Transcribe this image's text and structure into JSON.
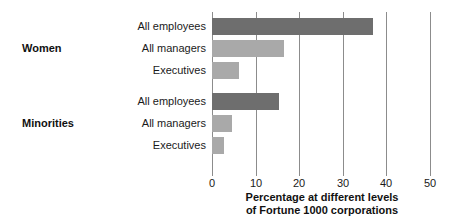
{
  "chart_data": {
    "type": "bar",
    "orientation": "horizontal",
    "title": "",
    "xlabel_lines": [
      "Percentage at different levels",
      "of Fortune 1000 corporations"
    ],
    "ylabel": "",
    "xlim": [
      0,
      50
    ],
    "xticks": [
      0,
      10,
      20,
      30,
      40,
      50
    ],
    "xtick_labels": [
      "0",
      "10",
      "20",
      "30",
      "40",
      "50"
    ],
    "grid": true,
    "grid_axis": "x",
    "legend": "none",
    "groups": [
      {
        "name": "Women",
        "bars": [
          {
            "label": "All employees",
            "value": 37,
            "color": "#6e6e6e"
          },
          {
            "label": "All managers",
            "value": 16.5,
            "color": "#a9a9a9"
          },
          {
            "label": "Executives",
            "value": 6.3,
            "color": "#a9a9a9"
          }
        ]
      },
      {
        "name": "Minorities",
        "bars": [
          {
            "label": "All employees",
            "value": 15.3,
            "color": "#6e6e6e"
          },
          {
            "label": "All managers",
            "value": 4.6,
            "color": "#a9a9a9"
          },
          {
            "label": "Executives",
            "value": 2.7,
            "color": "#a9a9a9"
          }
        ]
      }
    ],
    "categories": [
      "Women - All employees",
      "Women - All managers",
      "Women - Executives",
      "Minorities - All employees",
      "Minorities - All managers",
      "Minorities - Executives"
    ],
    "values": [
      37,
      16.5,
      6.3,
      15.3,
      4.6,
      2.7
    ],
    "colors": {
      "all_employees": "#6e6e6e",
      "managers_executives": "#a9a9a9",
      "axis": "#8c8c8c",
      "text": "#1a1a1a",
      "background": "#ffffff"
    }
  }
}
